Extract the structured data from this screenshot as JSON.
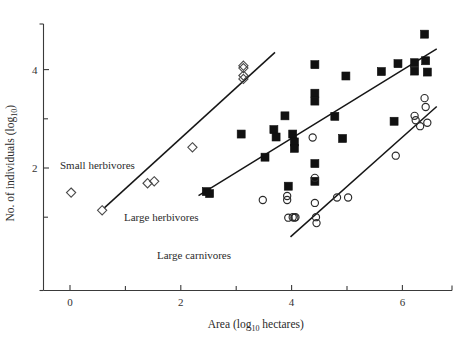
{
  "chart_data": {
    "type": "scatter",
    "title": "",
    "xlabel": "Area (log10 hectares)",
    "ylabel": "No. of individuals (log10)",
    "xlabel_parts": {
      "pre": "Area (log",
      "sub": "10",
      "post": " hectares)"
    },
    "ylabel_parts": {
      "pre": "No. of individuals (log",
      "sub": "10",
      "post": ")"
    },
    "xlim": [
      -0.6,
      6.9
    ],
    "ylim": [
      0.3,
      5.1
    ],
    "xticks_major": [
      0,
      2,
      4,
      6
    ],
    "xticks_minor": [
      1,
      3,
      5
    ],
    "yticks_major": [
      2,
      4
    ],
    "yticks_minor": [
      1,
      3,
      5
    ],
    "xtick_labels": [
      "0",
      "2",
      "4",
      "6"
    ],
    "ytick_labels": [
      "2",
      "4"
    ],
    "grid": false,
    "legend_position": "inline-annotations",
    "series": [
      {
        "name": "Small herbivores",
        "marker": "open-diamond",
        "color": "#4a4a4a",
        "points": [
          [
            0.02,
            1.5
          ],
          [
            0.58,
            1.14
          ],
          [
            1.4,
            1.69
          ],
          [
            1.52,
            1.73
          ],
          [
            2.21,
            2.42
          ],
          [
            3.13,
            4.08
          ],
          [
            3.13,
            4.03
          ],
          [
            3.13,
            3.88
          ],
          [
            3.13,
            3.81
          ]
        ]
      },
      {
        "name": "Large herbivores",
        "marker": "filled-square",
        "color": "#111111",
        "points": [
          [
            2.46,
            1.52
          ],
          [
            2.52,
            1.48
          ],
          [
            3.09,
            2.69
          ],
          [
            3.52,
            2.22
          ],
          [
            3.68,
            2.78
          ],
          [
            3.72,
            2.63
          ],
          [
            3.88,
            3.06
          ],
          [
            3.94,
            1.63
          ],
          [
            4.02,
            2.69
          ],
          [
            4.05,
            2.53
          ],
          [
            4.05,
            2.4
          ],
          [
            4.42,
            4.1
          ],
          [
            4.42,
            3.52
          ],
          [
            4.42,
            3.36
          ],
          [
            4.42,
            2.09
          ],
          [
            4.42,
            1.73
          ],
          [
            4.78,
            3.05
          ],
          [
            4.92,
            2.6
          ],
          [
            4.98,
            3.87
          ],
          [
            5.62,
            3.96
          ],
          [
            5.85,
            2.95
          ],
          [
            5.92,
            4.12
          ],
          [
            6.22,
            4.14
          ],
          [
            6.22,
            3.97
          ],
          [
            6.4,
            4.72
          ],
          [
            6.42,
            4.18
          ],
          [
            6.45,
            3.95
          ]
        ]
      },
      {
        "name": "Large carnivores",
        "marker": "open-circle",
        "color": "#2a2a2a",
        "points": [
          [
            3.48,
            1.35
          ],
          [
            3.92,
            1.43
          ],
          [
            3.92,
            1.35
          ],
          [
            3.94,
            0.99
          ],
          [
            4.02,
            1.0
          ],
          [
            4.05,
            0.99
          ],
          [
            4.07,
            1.0
          ],
          [
            4.38,
            2.62
          ],
          [
            4.42,
            1.8
          ],
          [
            4.42,
            1.29
          ],
          [
            4.44,
            1.0
          ],
          [
            4.45,
            0.88
          ],
          [
            4.82,
            1.4
          ],
          [
            5.02,
            1.4
          ],
          [
            5.88,
            2.25
          ],
          [
            6.22,
            3.06
          ],
          [
            6.24,
            2.97
          ],
          [
            6.32,
            2.85
          ],
          [
            6.4,
            3.42
          ],
          [
            6.42,
            3.24
          ],
          [
            6.45,
            2.92
          ]
        ]
      }
    ],
    "trend_lines": [
      {
        "name": "Small herbivores",
        "x1": 0.62,
        "y1": 1.19,
        "x2": 3.7,
        "y2": 4.35
      },
      {
        "name": "Large herbivores",
        "x1": 2.32,
        "y1": 1.44,
        "x2": 6.62,
        "y2": 4.42
      },
      {
        "name": "Large carnivores",
        "x1": 3.98,
        "y1": 0.6,
        "x2": 6.62,
        "y2": 3.25
      }
    ],
    "annotations": [
      {
        "text": "Small herbivores",
        "x_px": 60,
        "y_px": 169
      },
      {
        "text": "Large herbivores",
        "x_px": 124,
        "y_px": 221
      },
      {
        "text": "Large carnivores",
        "x_px": 157,
        "y_px": 259
      }
    ]
  }
}
